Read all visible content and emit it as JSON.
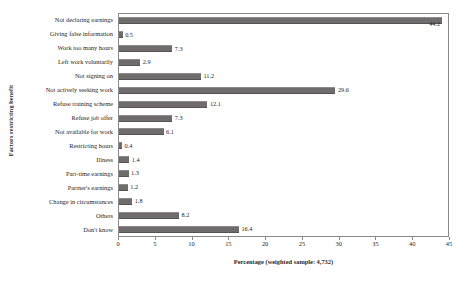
{
  "chart_data": {
    "type": "bar",
    "orientation": "horizontal",
    "title": "",
    "xlabel": "Percentage (weighted sample: 4,732)",
    "ylabel": "Factors restricting benefit",
    "xlim": [
      0,
      45
    ],
    "xticks": [
      0,
      5,
      10,
      15,
      20,
      25,
      30,
      35,
      40,
      45
    ],
    "grid": false,
    "legend": false,
    "bar_color": "#6e6c6c",
    "categories": [
      "Not declaring earnings",
      "Giving false information",
      "Work too many hours",
      "Left work voluntarily",
      "Not signing on",
      "Not actively seeking work",
      "Refuse training scheme",
      "Refuse job offer",
      "Not available for work",
      "Restricting hours",
      "Illness",
      "Part-time earnings",
      "Partner's earnings",
      "Change in circumstances",
      "Others",
      "Don't know"
    ],
    "values": [
      44.2,
      0.5,
      7.3,
      2.9,
      11.2,
      29.6,
      12.1,
      7.3,
      6.1,
      0.4,
      1.4,
      1.3,
      1.2,
      1.8,
      8.2,
      16.4
    ],
    "value_labels": [
      "44.2",
      "0.5",
      "7.3",
      "2.9",
      "11.2",
      "29.6",
      "12.1",
      "7.3",
      "6.1",
      "0.4",
      "1.4",
      "1.3",
      "1.2",
      "1.8",
      "8.2",
      "16.4"
    ]
  }
}
